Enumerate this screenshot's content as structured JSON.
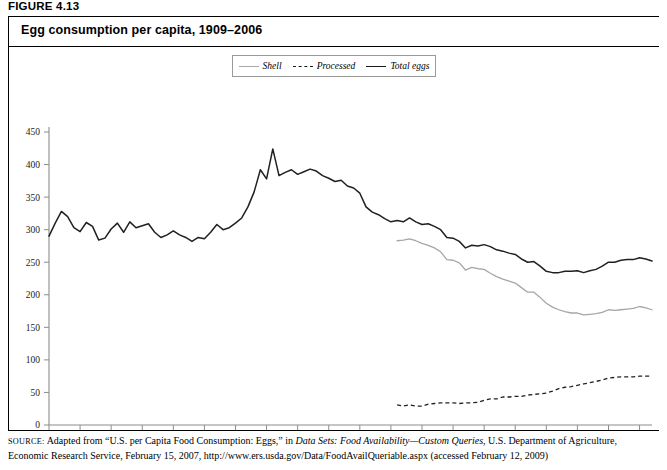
{
  "figure": {
    "label": "FIGURE 4.13",
    "title": "Egg consumption per capita, 1909–2006"
  },
  "legend": {
    "items": [
      {
        "label": "Shell",
        "style": "solid-light",
        "color": "#a6a6a6"
      },
      {
        "label": "Processed",
        "style": "dashed",
        "color": "#231f20"
      },
      {
        "label": "Total eggs",
        "style": "solid-dark",
        "color": "#231f20"
      }
    ]
  },
  "source": {
    "prefix": "SOURCE:",
    "line1_a": " Adapted from “U.S. per Capita Food Consumption: Eggs,” in ",
    "line1_italic": "Data Sets: Food Availability—Custom Queries",
    "line1_b": ", U.S. Department of Agriculture,",
    "line2": "Economic Research Service, February 15, 2007, http://www.ers.usda.gov/Data/FoodAvailQueriable.aspx (accessed February 12, 2009)"
  },
  "chart_data": {
    "type": "line",
    "title": "Egg consumption per capita, 1909–2006",
    "xlabel": "",
    "ylabel": "",
    "xlim": [
      1909,
      2006
    ],
    "ylim": [
      0,
      450
    ],
    "ytick_step": 50,
    "yticks": [
      0,
      50,
      100,
      150,
      200,
      250,
      300,
      350,
      400,
      450
    ],
    "xticks": [
      1909,
      1914,
      1919,
      1924,
      1929,
      1934,
      1939,
      1944,
      1949,
      1954,
      1959,
      1964,
      1969,
      1974,
      1979,
      1984,
      1989,
      1994,
      1999,
      2004
    ],
    "grid": false,
    "legend_position": "top-center",
    "units": "eggs per person per year",
    "series": [
      {
        "name": "Total eggs",
        "color": "#231f20",
        "dash": false,
        "x": [
          1909,
          1910,
          1911,
          1912,
          1913,
          1914,
          1915,
          1916,
          1917,
          1918,
          1919,
          1920,
          1921,
          1922,
          1923,
          1924,
          1925,
          1926,
          1927,
          1928,
          1929,
          1930,
          1931,
          1932,
          1933,
          1934,
          1935,
          1936,
          1937,
          1938,
          1939,
          1940,
          1941,
          1942,
          1943,
          1944,
          1945,
          1946,
          1947,
          1948,
          1949,
          1950,
          1951,
          1952,
          1953,
          1954,
          1955,
          1956,
          1957,
          1958,
          1959,
          1960,
          1961,
          1962,
          1963,
          1964,
          1965,
          1966,
          1967,
          1968,
          1969,
          1970,
          1971,
          1972,
          1973,
          1974,
          1975,
          1976,
          1977,
          1978,
          1979,
          1980,
          1981,
          1982,
          1983,
          1984,
          1985,
          1986,
          1987,
          1988,
          1989,
          1990,
          1991,
          1992,
          1993,
          1994,
          1995,
          1996,
          1997,
          1998,
          1999,
          2000,
          2001,
          2002,
          2003,
          2004,
          2005,
          2006
        ],
        "y": [
          290,
          310,
          328,
          320,
          303,
          297,
          311,
          305,
          284,
          287,
          301,
          310,
          296,
          312,
          303,
          306,
          309,
          296,
          288,
          292,
          298,
          292,
          288,
          282,
          288,
          286,
          296,
          308,
          300,
          303,
          310,
          318,
          335,
          358,
          392,
          378,
          424,
          383,
          388,
          392,
          385,
          389,
          393,
          390,
          383,
          379,
          374,
          376,
          367,
          364,
          356,
          335,
          327,
          323,
          317,
          312,
          314,
          312,
          318,
          312,
          308,
          309,
          305,
          300,
          288,
          287,
          282,
          272,
          276,
          275,
          277,
          274,
          269,
          267,
          264,
          262,
          255,
          250,
          251,
          244,
          236,
          234,
          234,
          236,
          236,
          237,
          234,
          237,
          239,
          244,
          250,
          250,
          253,
          254,
          254,
          257,
          255,
          252
        ]
      },
      {
        "name": "Shell",
        "color": "#a6a6a6",
        "dash": false,
        "x": [
          1965,
          1966,
          1967,
          1968,
          1969,
          1970,
          1971,
          1972,
          1973,
          1974,
          1975,
          1976,
          1977,
          1978,
          1979,
          1980,
          1981,
          1982,
          1983,
          1984,
          1985,
          1986,
          1987,
          1988,
          1989,
          1990,
          1991,
          1992,
          1993,
          1994,
          1995,
          1996,
          1997,
          1998,
          1999,
          2000,
          2001,
          2002,
          2003,
          2004,
          2005,
          2006
        ],
        "y": [
          283,
          284,
          286,
          283,
          279,
          276,
          272,
          266,
          254,
          253,
          249,
          238,
          242,
          240,
          239,
          233,
          228,
          224,
          221,
          218,
          211,
          204,
          204,
          196,
          187,
          181,
          177,
          174,
          172,
          172,
          169,
          170,
          171,
          173,
          177,
          176,
          177,
          178,
          179,
          182,
          180,
          177
        ]
      },
      {
        "name": "Processed",
        "color": "#231f20",
        "dash": true,
        "x": [
          1965,
          1966,
          1967,
          1968,
          1969,
          1970,
          1971,
          1972,
          1973,
          1974,
          1975,
          1976,
          1977,
          1978,
          1979,
          1980,
          1981,
          1982,
          1983,
          1984,
          1985,
          1986,
          1987,
          1988,
          1989,
          1990,
          1991,
          1992,
          1993,
          1994,
          1995,
          1996,
          1997,
          1998,
          1999,
          2000,
          2001,
          2002,
          2003,
          2004,
          2005,
          2006
        ],
        "y": [
          31,
          29,
          31,
          29,
          29,
          32,
          33,
          34,
          34,
          34,
          33,
          34,
          34,
          35,
          38,
          40,
          40,
          43,
          43,
          44,
          44,
          46,
          47,
          48,
          49,
          52,
          56,
          58,
          59,
          61,
          63,
          65,
          67,
          69,
          72,
          73,
          74,
          74,
          74,
          75,
          75,
          75
        ]
      }
    ]
  }
}
